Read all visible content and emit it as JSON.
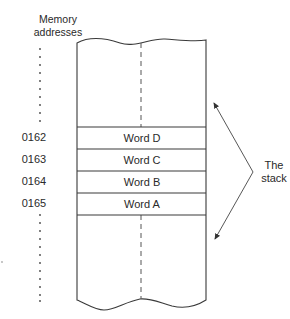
{
  "diagram": {
    "header": {
      "line1": "Memory",
      "line2": "addresses"
    },
    "rows": [
      {
        "address": "0162",
        "word": "Word D"
      },
      {
        "address": "0163",
        "word": "Word C"
      },
      {
        "address": "0164",
        "word": "Word B"
      },
      {
        "address": "0165",
        "word": "Word A"
      }
    ],
    "stack_label": {
      "line1": "The",
      "line2": "stack"
    },
    "colors": {
      "line": "#3a3a3a",
      "background": "#ffffff"
    }
  }
}
